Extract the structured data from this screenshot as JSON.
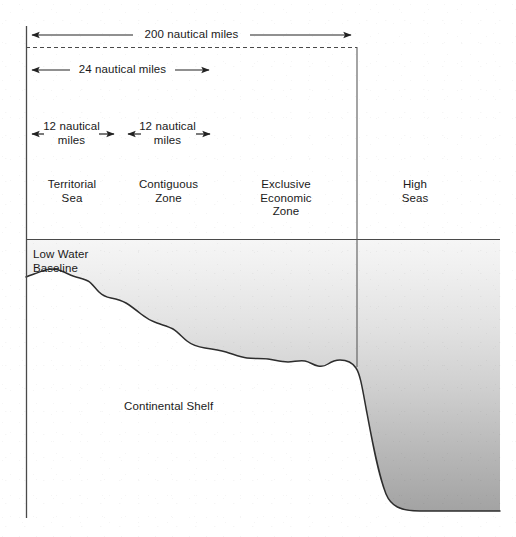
{
  "diagram": {
    "dimensions": [
      {
        "id": "dim-200nm",
        "label": "200 nautical miles",
        "value": 200,
        "unit": "nautical miles",
        "direction": "both"
      },
      {
        "id": "dim-24nm",
        "label": "24 nautical miles",
        "value": 24,
        "unit": "nautical miles",
        "direction": "both"
      },
      {
        "id": "dim-12nm-territorial",
        "label": "12 nautical\nmiles",
        "value": 12,
        "unit": "nautical miles",
        "direction": "both"
      },
      {
        "id": "dim-12nm-contiguous",
        "label": "12 nautical\nmiles",
        "value": 12,
        "unit": "nautical miles",
        "direction": "both"
      }
    ],
    "zones": [
      {
        "id": "zone-territorial-sea",
        "label": "Territorial\nSea"
      },
      {
        "id": "zone-contiguous",
        "label": "Contiguous\nZone"
      },
      {
        "id": "zone-eez",
        "label": "Exclusive\nEconomic\nZone"
      },
      {
        "id": "zone-high-seas",
        "label": "High\nSeas"
      }
    ],
    "features": [
      {
        "id": "feature-low-water-baseline",
        "label": "Low Water\nBaseline"
      },
      {
        "id": "feature-continental-shelf",
        "label": "Continental Shelf"
      }
    ],
    "colors": {
      "line": "#3a3a3a",
      "text": "#1a1a1a",
      "water_top": "#f2f2f2",
      "water_bottom": "#a6a6a6",
      "background": "#ffffff"
    }
  }
}
